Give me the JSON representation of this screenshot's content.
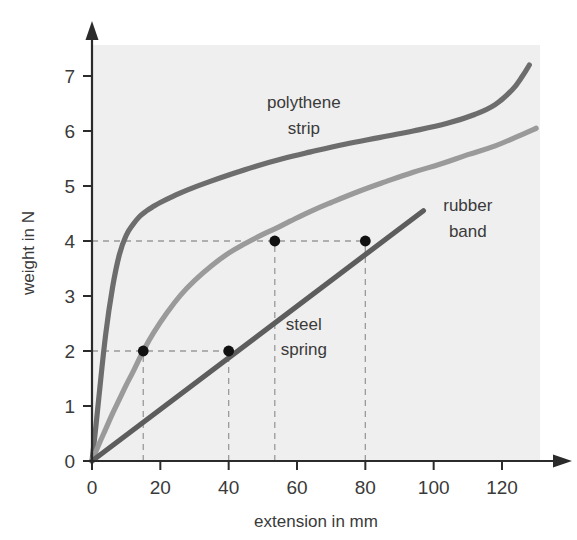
{
  "chart_data": {
    "type": "line",
    "title": "",
    "xlabel": "extension in mm",
    "ylabel": "weight in N",
    "xlim": [
      0,
      132
    ],
    "ylim": [
      0,
      7.6
    ],
    "xticks": [
      0,
      20,
      40,
      60,
      80,
      100,
      120
    ],
    "yticks": [
      0,
      1,
      2,
      3,
      4,
      5,
      6,
      7
    ],
    "xtick_labels": [
      "0",
      "20",
      "40",
      "60",
      "80",
      "100",
      "120"
    ],
    "ytick_labels": [
      "0",
      "1",
      "2",
      "3",
      "4",
      "5",
      "6",
      "7"
    ],
    "grid": false,
    "legend_position": "inline-annotations",
    "plot_background": "#efefef",
    "series": [
      {
        "name": "polythene strip",
        "color": "#6d6d6d",
        "label_text_line1": "polythene",
        "label_text_line2": "strip",
        "x": [
          0,
          1,
          2,
          4,
          6,
          8,
          10,
          12,
          14,
          16,
          18,
          20,
          24,
          28,
          34,
          40,
          48,
          56,
          64,
          74,
          84,
          94,
          104,
          112,
          118,
          123,
          126,
          128
        ],
        "y": [
          0,
          0.55,
          1.15,
          2.3,
          3.15,
          3.75,
          4.1,
          4.3,
          4.45,
          4.55,
          4.63,
          4.7,
          4.82,
          4.93,
          5.07,
          5.2,
          5.36,
          5.5,
          5.62,
          5.76,
          5.88,
          6.0,
          6.14,
          6.3,
          6.48,
          6.75,
          7.0,
          7.2
        ]
      },
      {
        "name": "rubber band",
        "color": "#9a9a9a",
        "label_text_line1": "rubber",
        "label_text_line2": "band",
        "x": [
          0,
          2,
          4,
          6,
          8,
          10,
          12,
          15,
          18,
          22,
          26,
          30,
          35,
          40,
          45,
          50,
          53.5,
          58,
          64,
          70,
          78,
          86,
          94,
          102,
          110,
          118,
          126,
          130
        ],
        "y": [
          0,
          0.3,
          0.58,
          0.86,
          1.12,
          1.38,
          1.62,
          2.0,
          2.33,
          2.7,
          3.02,
          3.28,
          3.55,
          3.78,
          3.96,
          4.12,
          4.22,
          4.36,
          4.54,
          4.7,
          4.9,
          5.08,
          5.25,
          5.4,
          5.57,
          5.73,
          5.94,
          6.05
        ]
      },
      {
        "name": "steel spring",
        "color": "#5d5d5d",
        "label_text_line1": "steel",
        "label_text_line2": "spring",
        "x": [
          0,
          97
        ],
        "y": [
          0,
          4.55
        ]
      }
    ],
    "markers": [
      {
        "x": 15,
        "y": 2,
        "series": "rubber band"
      },
      {
        "x": 40,
        "y": 2,
        "series": "steel spring"
      },
      {
        "x": 53.5,
        "y": 4,
        "series": "rubber band"
      },
      {
        "x": 80,
        "y": 4,
        "series": "steel spring"
      }
    ],
    "guide_lines": {
      "horizontal": [
        2,
        4
      ],
      "vertical": [
        15,
        40,
        53.5,
        80
      ],
      "color": "#9a9a9a",
      "style": "dashed"
    },
    "annotations": [
      {
        "text": "polythene",
        "x": 62,
        "y": 6.42
      },
      {
        "text": "strip",
        "x": 62,
        "y": 5.95
      },
      {
        "text": "rubber",
        "x": 110,
        "y": 4.55
      },
      {
        "text": "band",
        "x": 110,
        "y": 4.08
      },
      {
        "text": "steel",
        "x": 62,
        "y": 2.38
      },
      {
        "text": "spring",
        "x": 62,
        "y": 1.92
      }
    ]
  }
}
